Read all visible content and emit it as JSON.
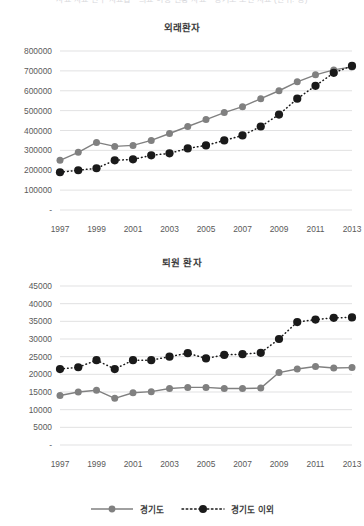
{
  "page": {
    "cutoff_header_text": "사료 자료 연구 자료집 · 의료 이용 현황 자료 · 경기도 보건 자료 (단위: 명)"
  },
  "colors": {
    "series_gyeonggi": "#808080",
    "series_outside": "#1a1a1a",
    "gridline": "#d4d4d6",
    "axis_text": "#5a5a5a",
    "title_text": "#3b3b3b",
    "background": "#ffffff"
  },
  "legend": {
    "items": [
      {
        "label": "경기도",
        "style": "solid",
        "color": "#808080",
        "marker": "circle"
      },
      {
        "label": "경기도 이외",
        "style": "dotted",
        "color": "#1a1a1a",
        "marker": "circle"
      }
    ]
  },
  "chart_data": [
    {
      "id": "chart1",
      "type": "line",
      "title": "외래환자",
      "xlabel": "",
      "ylabel": "",
      "grid": true,
      "legend_position": "bottom",
      "x": [
        1997,
        1998,
        1999,
        2000,
        2001,
        2002,
        2003,
        2004,
        2005,
        2006,
        2007,
        2008,
        2009,
        2010,
        2011,
        2012,
        2013
      ],
      "tick_labels_x": [
        "1997",
        "",
        "1999",
        "",
        "2001",
        "",
        "2003",
        "",
        "2005",
        "",
        "2007",
        "",
        "2009",
        "",
        "2011",
        "",
        "2013"
      ],
      "tick_labels_y": [
        "-",
        "100000",
        "200000",
        "300000",
        "400000",
        "500000",
        "600000",
        "700000",
        "800000"
      ],
      "ylim": [
        0,
        800000
      ],
      "yticks": [
        0,
        100000,
        200000,
        300000,
        400000,
        500000,
        600000,
        700000,
        800000
      ],
      "series": [
        {
          "name": "경기도",
          "style": "solid",
          "color": "#808080",
          "values": [
            250000,
            290000,
            340000,
            320000,
            325000,
            350000,
            385000,
            420000,
            455000,
            490000,
            520000,
            560000,
            600000,
            645000,
            680000,
            705000,
            720000
          ]
        },
        {
          "name": "경기도 이외",
          "style": "dotted",
          "color": "#1a1a1a",
          "values": [
            190000,
            200000,
            210000,
            250000,
            255000,
            275000,
            285000,
            310000,
            325000,
            350000,
            375000,
            420000,
            480000,
            560000,
            625000,
            690000,
            725000
          ]
        }
      ]
    },
    {
      "id": "chart2",
      "type": "line",
      "title": "퇴원 환자",
      "xlabel": "",
      "ylabel": "",
      "grid": true,
      "legend_position": "bottom",
      "x": [
        1997,
        1998,
        1999,
        2000,
        2001,
        2002,
        2003,
        2004,
        2005,
        2006,
        2007,
        2008,
        2009,
        2010,
        2011,
        2012,
        2013
      ],
      "tick_labels_x": [
        "1997",
        "",
        "1999",
        "",
        "2001",
        "",
        "2003",
        "",
        "2005",
        "",
        "2007",
        "",
        "2009",
        "",
        "2011",
        "",
        "2013"
      ],
      "tick_labels_y": [
        "-",
        "5000",
        "10000",
        "15000",
        "20000",
        "25000",
        "30000",
        "35000",
        "40000",
        "45000"
      ],
      "ylim": [
        0,
        45000
      ],
      "yticks": [
        0,
        5000,
        10000,
        15000,
        20000,
        25000,
        30000,
        35000,
        40000,
        45000
      ],
      "series": [
        {
          "name": "경기도",
          "style": "solid",
          "color": "#808080",
          "values": [
            14000,
            15000,
            15500,
            13200,
            14800,
            15100,
            16000,
            16300,
            16300,
            16000,
            16000,
            16100,
            20500,
            21500,
            22200,
            21800,
            21900
          ]
        },
        {
          "name": "경기도 이외",
          "style": "dotted",
          "color": "#1a1a1a",
          "values": [
            21500,
            22000,
            24000,
            21500,
            24000,
            24000,
            25000,
            26000,
            24500,
            25500,
            25700,
            26100,
            30000,
            34800,
            35500,
            36000,
            36100
          ]
        }
      ]
    }
  ]
}
